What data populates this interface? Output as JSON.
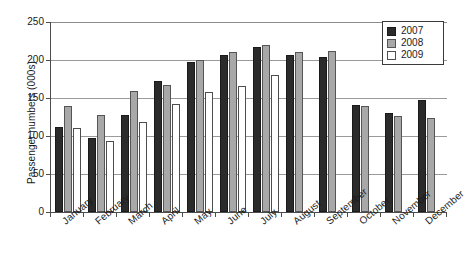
{
  "chart_data": {
    "type": "bar",
    "title": "",
    "xlabel": "",
    "ylabel": "Passenger numbers (000s)",
    "ylim": [
      0,
      250
    ],
    "yticks": [
      0,
      50,
      100,
      150,
      200,
      250
    ],
    "grid": true,
    "legend_position": "top-right",
    "categories": [
      "January",
      "February",
      "March",
      "April",
      "May",
      "June",
      "July",
      "August",
      "September",
      "October",
      "November",
      "December"
    ],
    "series": [
      {
        "name": "2007",
        "color": "#2b2b2b",
        "values": [
          112,
          98,
          127,
          172,
          198,
          207,
          217,
          207,
          204,
          141,
          130,
          147
        ]
      },
      {
        "name": "2008",
        "color": "#a8a8a8",
        "values": [
          140,
          128,
          159,
          167,
          200,
          210,
          220,
          211,
          212,
          139,
          126,
          124
        ]
      },
      {
        "name": "2009",
        "color": "#ffffff",
        "values": [
          110,
          94,
          119,
          142,
          158,
          166,
          180,
          null,
          null,
          null,
          null,
          null
        ]
      }
    ]
  },
  "legend": {
    "entries": [
      {
        "label": "2007",
        "swatch": "y2007"
      },
      {
        "label": "2008",
        "swatch": "y2008"
      },
      {
        "label": "2009",
        "swatch": "y2009"
      }
    ]
  }
}
